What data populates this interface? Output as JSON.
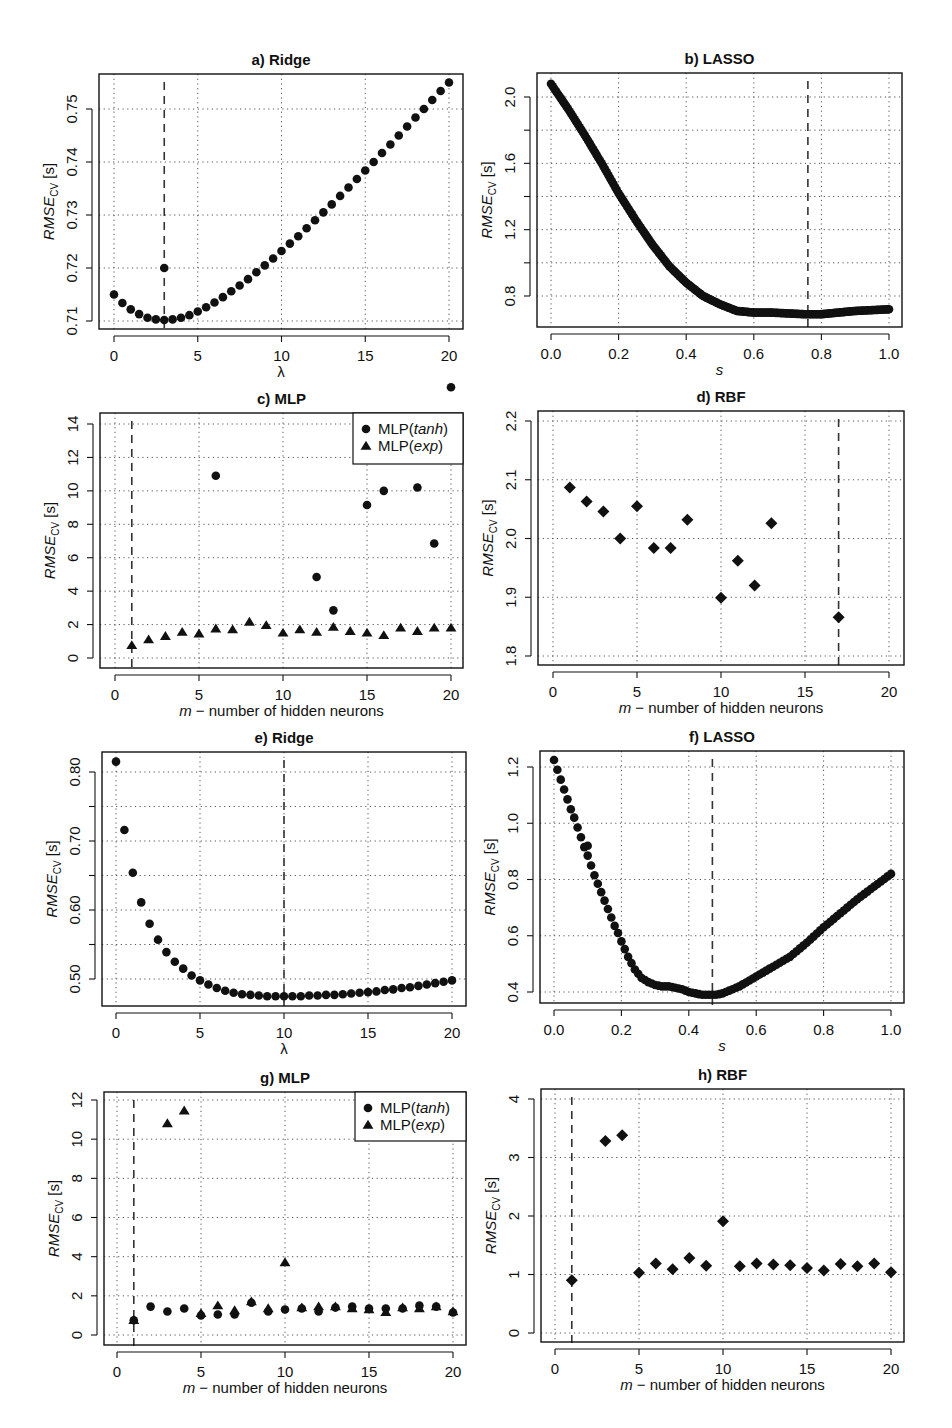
{
  "figure": {
    "background": "#ffffff",
    "ink": "#111111",
    "grid_color": "#555555"
  },
  "chart_data": [
    {
      "id": "a",
      "type": "scatter",
      "title": "a) Ridge",
      "xlabel": "λ",
      "ylabel": "RMSE_CV [s]",
      "ylabel_main": "RMSE",
      "ylabel_sub": "CV",
      "ylabel_unit": " [s]",
      "box": [
        99,
        74,
        463,
        329
      ],
      "xmap": [
        0,
        114,
        20,
        449
      ],
      "ymap": [
        0.71,
        321,
        0.75,
        109
      ],
      "xticks": [
        0,
        5,
        10,
        15,
        20
      ],
      "xtick_labels": [
        "0",
        "5",
        "10",
        "15",
        "20"
      ],
      "yticks": [
        0.71,
        0.72,
        0.73,
        0.74,
        0.75
      ],
      "ytick_labels": [
        "0.71",
        "0.72",
        "0.73",
        "0.74",
        "0.75"
      ],
      "grid": true,
      "vline": 3,
      "marker": "circle",
      "series": [
        {
          "name": "Ridge",
          "marker": "circle",
          "x": [
            0,
            0.5,
            1,
            1.5,
            2,
            2.5,
            3,
            3.5,
            4,
            4.5,
            5,
            5.5,
            6,
            6.5,
            7,
            7.5,
            8,
            8.5,
            9,
            9.5,
            10,
            10.5,
            11,
            11.5,
            12,
            12.5,
            13,
            13.5,
            14,
            14.5,
            15,
            15.5,
            16,
            16.5,
            17,
            17.5,
            18,
            18.5,
            19,
            19.5,
            20,
            3
          ],
          "y": [
            0.715,
            0.7134,
            0.7122,
            0.7113,
            0.7106,
            0.7103,
            0.7102,
            0.7103,
            0.7106,
            0.7111,
            0.7118,
            0.7126,
            0.7135,
            0.7145,
            0.7156,
            0.7167,
            0.7179,
            0.7192,
            0.7205,
            0.7218,
            0.7232,
            0.7246,
            0.726,
            0.7275,
            0.729,
            0.7305,
            0.732,
            0.7336,
            0.7352,
            0.7368,
            0.7384,
            0.74,
            0.7417,
            0.7433,
            0.745,
            0.7467,
            0.7484,
            0.75,
            0.7517,
            0.7534,
            0.755,
            0.72
          ]
        }
      ]
    },
    {
      "id": "b",
      "type": "scatter",
      "title": "b) LASSO",
      "xlabel": "s",
      "ylabel": "RMSE_CV [s]",
      "ylabel_main": "RMSE",
      "ylabel_sub": "CV",
      "ylabel_unit": " [s]",
      "box": [
        537,
        73,
        902,
        327
      ],
      "xmap": [
        0,
        551,
        1,
        889
      ],
      "ymap": [
        0.8,
        296,
        2.0,
        97
      ],
      "xticks": [
        0,
        0.2,
        0.4,
        0.6,
        0.8,
        1.0
      ],
      "xtick_labels": [
        "0.0",
        "0.2",
        "0.4",
        "0.6",
        "0.8",
        "1.0"
      ],
      "yticks": [
        0.8,
        1.0,
        1.2,
        1.4,
        1.6,
        1.8,
        2.0
      ],
      "ytick_labels": [
        "0.8",
        "",
        "1.2",
        "",
        "1.6",
        "",
        "2.0"
      ],
      "grid": true,
      "vline": 0.76,
      "marker": "circle-dense",
      "series": [
        {
          "name": "LASSO",
          "marker": "circle",
          "x": [
            0.0,
            0.05,
            0.1,
            0.15,
            0.2,
            0.25,
            0.3,
            0.35,
            0.4,
            0.45,
            0.5,
            0.55,
            0.6,
            0.65,
            0.7,
            0.75,
            0.8,
            0.85,
            0.9,
            0.95,
            1.0
          ],
          "y": [
            2.08,
            1.93,
            1.77,
            1.6,
            1.42,
            1.26,
            1.11,
            0.98,
            0.88,
            0.8,
            0.75,
            0.71,
            0.7,
            0.7,
            0.695,
            0.69,
            0.69,
            0.7,
            0.71,
            0.715,
            0.72
          ]
        }
      ]
    },
    {
      "id": "c",
      "type": "scatter",
      "title": "c) MLP",
      "xlabel": "m − number of hidden neurons",
      "xlabel_var": "m",
      "xlabel_rest": " − number of hidden neurons",
      "ylabel": "RMSE_CV [s]",
      "ylabel_main": "RMSE",
      "ylabel_sub": "CV",
      "ylabel_unit": " [s]",
      "box": [
        100,
        413,
        463,
        668
      ],
      "xmap": [
        0,
        115,
        20,
        451
      ],
      "ymap": [
        0,
        658,
        14,
        424
      ],
      "xticks": [
        0,
        5,
        10,
        15,
        20
      ],
      "xtick_labels": [
        "0",
        "5",
        "10",
        "15",
        "20"
      ],
      "yticks": [
        0,
        2,
        4,
        6,
        8,
        10,
        12,
        14
      ],
      "ytick_labels": [
        "0",
        "2",
        "4",
        "6",
        "8",
        "10",
        "12",
        "14"
      ],
      "grid": true,
      "vline": 1,
      "legend": {
        "position": "top-right",
        "items": [
          {
            "marker": "circle",
            "label_main": "MLP(",
            "label_ital": "tanh",
            "label_end": ")"
          },
          {
            "marker": "triangle",
            "label_main": "MLP(",
            "label_ital": "exp",
            "label_end": ")"
          }
        ],
        "box": [
          353,
          413,
          463,
          464
        ]
      },
      "series": [
        {
          "name": "MLP(tanh)",
          "marker": "circle",
          "x": [
            6,
            12,
            13,
            15,
            16,
            18,
            19,
            20
          ],
          "y": [
            10.9,
            4.85,
            2.85,
            9.15,
            10.0,
            10.2,
            6.85,
            16.2
          ]
        },
        {
          "name": "MLP(exp)",
          "marker": "triangle",
          "x": [
            1,
            2,
            3,
            4,
            5,
            6,
            7,
            8,
            9,
            10,
            11,
            12,
            13,
            14,
            15,
            16,
            17,
            18,
            19,
            20
          ],
          "y": [
            0.75,
            1.1,
            1.3,
            1.55,
            1.45,
            1.75,
            1.7,
            2.15,
            1.95,
            1.5,
            1.7,
            1.55,
            1.85,
            1.6,
            1.5,
            1.35,
            1.8,
            1.6,
            1.8,
            1.8
          ]
        }
      ]
    },
    {
      "id": "d",
      "type": "scatter",
      "title": "d) RBF",
      "xlabel": "m − number of hidden neurons",
      "xlabel_var": "m",
      "xlabel_rest": " − number of hidden neurons",
      "ylabel": "RMSE_CV [s]",
      "ylabel_main": "RMSE",
      "ylabel_sub": "CV",
      "ylabel_unit": " [s]",
      "box": [
        538,
        411,
        904,
        665
      ],
      "xmap": [
        0,
        553,
        20,
        889
      ],
      "ymap": [
        1.8,
        656,
        2.2,
        421
      ],
      "xticks": [
        0,
        5,
        10,
        15,
        20
      ],
      "xtick_labels": [
        "0",
        "5",
        "10",
        "15",
        "20"
      ],
      "yticks": [
        1.8,
        1.9,
        2.0,
        2.1,
        2.2
      ],
      "ytick_labels": [
        "1.8",
        "1.9",
        "2.0",
        "2.1",
        "2.2"
      ],
      "grid": true,
      "vline": 17,
      "series": [
        {
          "name": "RBF",
          "marker": "diamond",
          "x": [
            1,
            2,
            3,
            4,
            5,
            6,
            7,
            8,
            10,
            11,
            12,
            13,
            17
          ],
          "y": [
            2.087,
            2.063,
            2.046,
            2.0,
            2.055,
            1.984,
            1.984,
            2.032,
            1.899,
            1.962,
            1.92,
            2.026,
            1.866
          ]
        }
      ]
    },
    {
      "id": "e",
      "type": "scatter",
      "title": "e) Ridge",
      "xlabel": "λ",
      "ylabel": "RMSE_CV [s]",
      "ylabel_main": "RMSE",
      "ylabel_sub": "CV",
      "ylabel_unit": " [s]",
      "box": [
        102,
        752,
        466,
        1006
      ],
      "xmap": [
        0,
        116,
        20,
        452
      ],
      "ymap": [
        0.5,
        979,
        0.8,
        772
      ],
      "xticks": [
        0,
        5,
        10,
        15,
        20
      ],
      "xtick_labels": [
        "0",
        "5",
        "10",
        "15",
        "20"
      ],
      "yticks": [
        0.5,
        0.55,
        0.6,
        0.65,
        0.7,
        0.75,
        0.8
      ],
      "ytick_labels": [
        "0.50",
        "",
        "0.60",
        "",
        "0.70",
        "",
        "0.80"
      ],
      "grid": true,
      "vline": 10,
      "series": [
        {
          "name": "Ridge",
          "marker": "circle",
          "x": [
            0,
            0.5,
            1,
            1.5,
            2,
            2.5,
            3,
            3.5,
            4,
            4.5,
            5,
            5.5,
            6,
            6.5,
            7,
            7.5,
            8,
            8.5,
            9,
            9.5,
            10,
            10.5,
            11,
            11.5,
            12,
            12.5,
            13,
            13.5,
            14,
            14.5,
            15,
            15.5,
            16,
            16.5,
            17,
            17.5,
            18,
            18.5,
            19,
            19.5,
            20
          ],
          "y": [
            0.815,
            0.716,
            0.654,
            0.611,
            0.58,
            0.557,
            0.539,
            0.525,
            0.515,
            0.505,
            0.498,
            0.492,
            0.487,
            0.483,
            0.48,
            0.478,
            0.477,
            0.476,
            0.475,
            0.475,
            0.475,
            0.475,
            0.475,
            0.476,
            0.476,
            0.477,
            0.477,
            0.478,
            0.479,
            0.48,
            0.481,
            0.482,
            0.484,
            0.485,
            0.487,
            0.488,
            0.49,
            0.492,
            0.494,
            0.496,
            0.498
          ]
        }
      ]
    },
    {
      "id": "f",
      "type": "scatter",
      "title": "f) LASSO",
      "xlabel": "s",
      "ylabel": "RMSE_CV [s]",
      "ylabel_main": "RMSE",
      "ylabel_sub": "CV",
      "ylabel_unit": " [s]",
      "box": [
        540,
        751,
        904,
        1003
      ],
      "xmap": [
        0,
        554,
        1,
        891
      ],
      "ymap": [
        0.4,
        992,
        1.2,
        767
      ],
      "xticks": [
        0,
        0.2,
        0.4,
        0.6,
        0.8,
        1.0
      ],
      "xtick_labels": [
        "0.0",
        "0.2",
        "0.4",
        "0.6",
        "0.8",
        "1.0"
      ],
      "yticks": [
        0.4,
        0.6,
        0.8,
        1.0,
        1.2
      ],
      "ytick_labels": [
        "0.4",
        "0.6",
        "0.8",
        "1.0",
        "1.2"
      ],
      "grid": true,
      "vline": 0.47,
      "series": [
        {
          "name": "LASSO",
          "marker": "circle",
          "x": [
            0.0,
            0.01,
            0.02,
            0.03,
            0.04,
            0.05,
            0.06,
            0.07,
            0.08,
            0.09,
            0.1,
            0.11,
            0.12,
            0.13,
            0.14,
            0.15,
            0.16,
            0.17,
            0.18,
            0.19,
            0.2,
            0.22,
            0.24,
            0.26,
            0.28,
            0.3,
            0.32,
            0.34,
            0.36,
            0.38,
            0.4,
            0.42,
            0.44,
            0.46,
            0.48,
            0.5,
            0.55,
            0.6,
            0.65,
            0.7,
            0.75,
            0.8,
            0.85,
            0.9,
            0.95,
            1.0
          ],
          "y": [
            1.225,
            1.19,
            1.155,
            1.12,
            1.085,
            1.05,
            1.02,
            0.985,
            0.95,
            0.915,
            0.885,
            0.85,
            0.815,
            0.785,
            0.755,
            0.725,
            0.695,
            0.665,
            0.635,
            0.61,
            0.58,
            0.525,
            0.48,
            0.45,
            0.435,
            0.425,
            0.42,
            0.42,
            0.415,
            0.41,
            0.4,
            0.395,
            0.39,
            0.39,
            0.39,
            0.395,
            0.42,
            0.455,
            0.49,
            0.525,
            0.575,
            0.63,
            0.68,
            0.73,
            0.775,
            0.82
          ]
        }
      ]
    },
    {
      "id": "g",
      "type": "scatter",
      "title": "g) MLP",
      "xlabel": "m − number of hidden neurons",
      "xlabel_var": "m",
      "xlabel_rest": " − number of hidden neurons",
      "ylabel": "RMSE_CV [s]",
      "ylabel_main": "RMSE",
      "ylabel_sub": "CV",
      "ylabel_unit": " [s]",
      "box": [
        104,
        1092,
        466,
        1345
      ],
      "xmap": [
        0,
        117,
        20,
        453
      ],
      "ymap": [
        0,
        1335,
        12,
        1100
      ],
      "xticks": [
        0,
        5,
        10,
        15,
        20
      ],
      "xtick_labels": [
        "0",
        "5",
        "10",
        "15",
        "20"
      ],
      "yticks": [
        0,
        2,
        4,
        6,
        8,
        10,
        12
      ],
      "ytick_labels": [
        "0",
        "2",
        "4",
        "6",
        "8",
        "10",
        "12"
      ],
      "grid": true,
      "vline": 1,
      "legend": {
        "position": "top-right",
        "items": [
          {
            "marker": "circle",
            "label_main": "MLP(",
            "label_ital": "tanh",
            "label_end": ")"
          },
          {
            "marker": "triangle",
            "label_main": "MLP(",
            "label_ital": "exp",
            "label_end": ")"
          }
        ],
        "box": [
          355,
          1092,
          466,
          1141
        ]
      },
      "series": [
        {
          "name": "MLP(tanh)",
          "marker": "circle",
          "x": [
            1,
            2,
            3,
            4,
            5,
            6,
            7,
            8,
            9,
            10,
            11,
            12,
            13,
            14,
            15,
            16,
            17,
            18,
            19,
            20
          ],
          "y": [
            0.75,
            1.45,
            1.2,
            1.35,
            1.0,
            1.05,
            1.05,
            1.65,
            1.2,
            1.3,
            1.35,
            1.2,
            1.4,
            1.45,
            1.35,
            1.35,
            1.35,
            1.5,
            1.45,
            1.15
          ]
        },
        {
          "name": "MLP(exp)",
          "marker": "triangle",
          "x": [
            1,
            3,
            4,
            5,
            6,
            7,
            8,
            9,
            10,
            11,
            12,
            13,
            14,
            15,
            16,
            17,
            18,
            19,
            20
          ],
          "y": [
            0.75,
            10.8,
            11.45,
            1.1,
            1.5,
            1.25,
            1.7,
            1.35,
            3.7,
            1.4,
            1.45,
            1.45,
            1.35,
            1.3,
            1.15,
            1.4,
            1.35,
            1.45,
            1.2
          ]
        }
      ]
    },
    {
      "id": "h",
      "type": "scatter",
      "title": "h) RBF",
      "xlabel": "m − number of hidden neurons",
      "xlabel_var": "m",
      "xlabel_rest": " − number of hidden neurons",
      "ylabel": "RMSE_CV [s]",
      "ylabel_main": "RMSE",
      "ylabel_sub": "CV",
      "ylabel_unit": " [s]",
      "box": [
        541,
        1089,
        904,
        1342
      ],
      "xmap": [
        0,
        555,
        20,
        891
      ],
      "ymap": [
        0,
        1333,
        4,
        1099
      ],
      "xticks": [
        0,
        5,
        10,
        15,
        20
      ],
      "xtick_labels": [
        "0",
        "5",
        "10",
        "15",
        "20"
      ],
      "yticks": [
        0,
        1,
        2,
        3,
        4
      ],
      "ytick_labels": [
        "0",
        "1",
        "2",
        "3",
        "4"
      ],
      "grid": true,
      "vline": 1,
      "series": [
        {
          "name": "RBF",
          "marker": "diamond",
          "x": [
            1,
            3,
            4,
            5,
            6,
            7,
            8,
            9,
            10,
            11,
            12,
            13,
            14,
            15,
            16,
            17,
            18,
            19,
            20
          ],
          "y": [
            0.9,
            3.28,
            3.38,
            1.03,
            1.19,
            1.09,
            1.28,
            1.15,
            1.91,
            1.14,
            1.19,
            1.17,
            1.16,
            1.11,
            1.07,
            1.18,
            1.14,
            1.19,
            1.04
          ]
        }
      ]
    }
  ]
}
